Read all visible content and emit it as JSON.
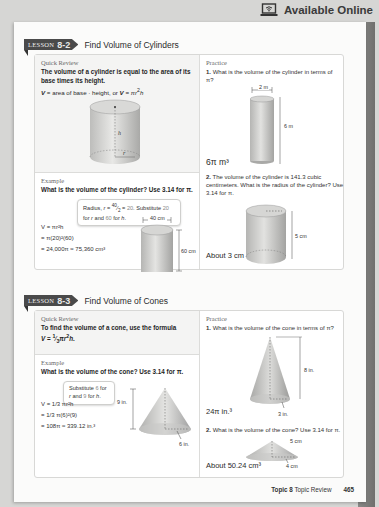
{
  "header": {
    "online_icon": "laptop-wifi-icon",
    "online_label": "Available Online"
  },
  "lessons": [
    {
      "tab_label": "LESSON",
      "number": "8-2",
      "title": "Find Volume of Cylinders",
      "quick_review": {
        "heading": "Quick Review",
        "statement": "The volume of a cylinder is equal to the area of its base times its height.",
        "formula": "V = area of base · height, or V = πr2h",
        "figure_labels": {
          "height": "h",
          "radius": "r"
        }
      },
      "example": {
        "heading": "Example",
        "question": "What is the volume of the cylinder? Use 3.14 for π.",
        "callout": "Radius, r = 40/2 = 20. Substitute 20 for r and 60 for h.",
        "steps": [
          "V = πr²h",
          "= π(20)²(60)",
          "= 24,000π ≈ 75,360 cm³"
        ],
        "figure_labels": {
          "diameter": "40 cm",
          "height": "60 cm"
        }
      },
      "practice": {
        "heading": "Practice",
        "items": [
          {
            "number": "1.",
            "question": "What is the volume of the cylinder in terms of π?",
            "figure_labels": {
              "diameter": "2 m",
              "height": "6 m"
            },
            "answer": "6π m³"
          },
          {
            "number": "2.",
            "question": "The volume of the cylinder is 141.3 cubic centimeters. What is the radius of the cylinder? Use 3.14 for π.",
            "figure_labels": {
              "height": "5 cm"
            },
            "answer": "About 3 cm"
          }
        ]
      }
    },
    {
      "tab_label": "LESSON",
      "number": "8-3",
      "title": "Find Volume of Cones",
      "quick_review": {
        "heading": "Quick Review",
        "statement": "To find the volume of a cone, use the formula V = 1/3 πr²h."
      },
      "example": {
        "heading": "Example",
        "question": "What is the volume of the cone? Use 3.14 for π.",
        "callout": "Substitute 6 for r and 9 for h.",
        "steps": [
          "V = 1/3 πr²h",
          "= 1/3 π(6)²(9)",
          "= 108π ≈ 339.12 in.³"
        ],
        "figure_labels": {
          "height": "9 in.",
          "radius": "6 in."
        }
      },
      "practice": {
        "heading": "Practice",
        "items": [
          {
            "number": "1.",
            "question": "What is the volume of the cone in terms of π?",
            "figure_labels": {
              "height": "8 in.",
              "radius": "3 in."
            },
            "answer": "24π in.³"
          },
          {
            "number": "2.",
            "question": "What is the volume of the cone? Use 3.14 for π.",
            "figure_labels": {
              "slant": "5 cm",
              "radius": "4 cm"
            },
            "answer": "About 50.24 cm³"
          }
        ]
      }
    }
  ],
  "footer": {
    "topic": "Topic 8",
    "section": "Topic Review",
    "page_number": "465"
  },
  "colors": {
    "background": "#d6d6d4",
    "page": "#fbfbfa",
    "tab": "#4a4a4a",
    "quick_review_bg": "#f4f4f3"
  }
}
